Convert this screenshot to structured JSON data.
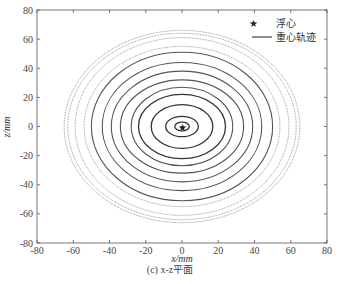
{
  "chart_data": {
    "type": "line",
    "title": "",
    "caption": "(c)  x-z平面",
    "xlabel": "x/mm",
    "ylabel": "z/mm",
    "xlim": [
      -80,
      80
    ],
    "ylim": [
      -80,
      80
    ],
    "xticks": [
      -80,
      -60,
      -40,
      -20,
      0,
      20,
      40,
      60,
      80
    ],
    "yticks": [
      -80,
      -60,
      -40,
      -20,
      0,
      20,
      40,
      60,
      80
    ],
    "grid": false,
    "legend": {
      "position": "upper-right",
      "entries": [
        {
          "label": "浮心",
          "marker": "star"
        },
        {
          "label": "重心轨迹",
          "marker": "line"
        }
      ]
    },
    "buoyancy_center": {
      "x": 0,
      "z": 0
    },
    "series": [
      {
        "name": "重心轨迹",
        "description": "concentric elliptical orbits about origin; outer rings dotted/lighter",
        "rings": [
          {
            "rx": 4,
            "rz": 3,
            "style": "solid"
          },
          {
            "rx": 9,
            "rz": 7,
            "style": "solid"
          },
          {
            "rx": 17,
            "rz": 15,
            "style": "solid"
          },
          {
            "rx": 24,
            "rz": 22,
            "style": "solid"
          },
          {
            "rx": 28,
            "rz": 27,
            "style": "solid"
          },
          {
            "rx": 34,
            "rz": 32,
            "style": "solid"
          },
          {
            "rx": 39,
            "rz": 38,
            "style": "solid"
          },
          {
            "rx": 44,
            "rz": 44,
            "style": "solid"
          },
          {
            "rx": 50,
            "rz": 51,
            "style": "solid"
          },
          {
            "rx": 54,
            "rz": 55,
            "style": "dotted"
          },
          {
            "rx": 59,
            "rz": 61,
            "style": "dotted"
          },
          {
            "rx": 63,
            "rz": 64,
            "style": "dotted"
          },
          {
            "rx": 65,
            "rz": 66,
            "style": "dotted"
          }
        ]
      }
    ]
  },
  "axes": {
    "xlabel": "x/mm",
    "ylabel": "z/mm"
  },
  "legend": {
    "item1": "浮心",
    "item2": "重心轨迹"
  },
  "caption": "(c)  x-z平面"
}
